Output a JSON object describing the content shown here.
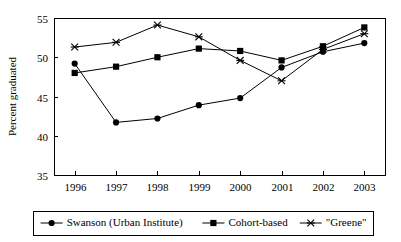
{
  "chart_data": {
    "type": "line",
    "title": "",
    "xlabel": "",
    "ylabel": "Percent graduated",
    "categories": [
      "1996",
      "1997",
      "1998",
      "1999",
      "2000",
      "2001",
      "2002",
      "2003"
    ],
    "xlim": [
      1996,
      2003
    ],
    "ylim": [
      35,
      55
    ],
    "yticks": [
      35,
      40,
      45,
      50,
      55
    ],
    "ytick_labels": [
      "35",
      "40",
      "45",
      "50",
      "55"
    ],
    "grid": false,
    "legend_position": "bottom",
    "series": [
      {
        "name": "Swanson (Urban Institute)",
        "marker": "circle",
        "values": [
          49.2,
          41.7,
          42.2,
          43.9,
          44.8,
          48.7,
          50.7,
          51.8
        ]
      },
      {
        "name": "Cohort-based",
        "marker": "square",
        "values": [
          48.0,
          48.8,
          50.0,
          51.1,
          50.8,
          49.6,
          51.4,
          53.8
        ]
      },
      {
        "name": "\"Greene\"",
        "marker": "x",
        "values": [
          51.3,
          51.9,
          54.1,
          52.6,
          49.6,
          47.0,
          51.0,
          53.0
        ]
      }
    ]
  },
  "axis": {
    "y_title": "Percent graduated"
  },
  "legend": {
    "entries": [
      {
        "label": "Swanson (Urban Institute)"
      },
      {
        "label": "Cohort-based"
      },
      {
        "label": "\"Greene\""
      }
    ]
  },
  "colors": {
    "line": "#000000",
    "axis": "#000000",
    "background": "#ffffff"
  }
}
